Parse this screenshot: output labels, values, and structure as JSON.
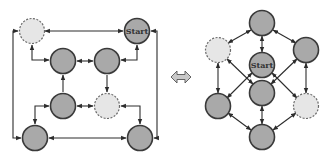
{
  "diagram": {
    "left": {
      "name": "grid-layout",
      "nodes": [
        {
          "id": "L1",
          "style": "dashed",
          "label": ""
        },
        {
          "id": "L2",
          "style": "solid",
          "label": "Start"
        },
        {
          "id": "L3",
          "style": "solid",
          "label": ""
        },
        {
          "id": "L4",
          "style": "solid",
          "label": ""
        },
        {
          "id": "L5",
          "style": "solid",
          "label": ""
        },
        {
          "id": "L6",
          "style": "dashed",
          "label": ""
        },
        {
          "id": "L7",
          "style": "solid",
          "label": ""
        },
        {
          "id": "L8",
          "style": "solid",
          "label": ""
        }
      ],
      "start_label": "Start"
    },
    "equivalence_symbol": "double-headed-arrow",
    "right": {
      "name": "cube-layout",
      "nodes": [
        {
          "id": "R1",
          "style": "solid",
          "label": ""
        },
        {
          "id": "R2",
          "style": "dashed",
          "label": ""
        },
        {
          "id": "R3",
          "style": "solid",
          "label": ""
        },
        {
          "id": "R4",
          "style": "solid",
          "label": "Start"
        },
        {
          "id": "R5",
          "style": "solid",
          "label": ""
        },
        {
          "id": "R6",
          "style": "solid",
          "label": ""
        },
        {
          "id": "R7",
          "style": "dashed",
          "label": ""
        },
        {
          "id": "R8",
          "style": "solid",
          "label": ""
        }
      ],
      "start_label": "Start"
    },
    "colors": {
      "solid_node": "#a9a9a9",
      "dashed_node": "#e6e6e6",
      "stroke": "#3a3a3a",
      "arrow_fill": "#c8c8c8"
    }
  }
}
